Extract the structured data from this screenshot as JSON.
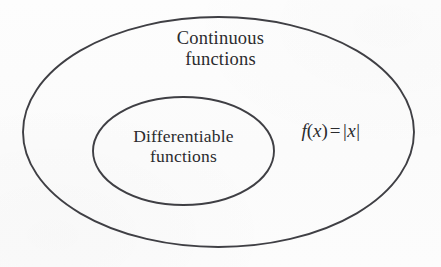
{
  "figure": {
    "type": "euler-diagram",
    "background_color": "#fcfcfc",
    "stroke_color": "#3f3f44",
    "text_color": "#2b2b2e"
  },
  "outer_set": {
    "name": "continuous-functions",
    "label_line_1": "Continuous",
    "label_line_2": "functions",
    "ellipse": {
      "cx": 218.5,
      "cy": 132,
      "rx": 195.5,
      "ry": 115
    }
  },
  "inner_set": {
    "name": "differentiable-functions",
    "label_line_1": "Differentiable",
    "label_line_2": "functions",
    "ellipse": {
      "cx": 183.5,
      "cy": 151,
      "rx": 90.5,
      "ry": 54
    }
  },
  "annotation": {
    "name": "example-function",
    "f": "f",
    "open_paren": "(",
    "arg": "x",
    "close_paren": ")",
    "equals": "=",
    "left_bar": "|",
    "abs_arg": "x",
    "right_bar": "|",
    "plain_text": "f(x) = |x|"
  }
}
